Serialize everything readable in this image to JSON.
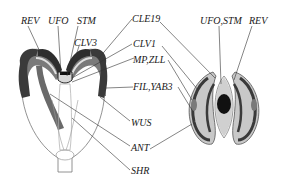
{
  "diagram": {
    "type": "gene expression schematic",
    "panels": [
      {
        "id": "longitudinal",
        "description": "longitudinal section of embryo"
      },
      {
        "id": "transverse",
        "description": "transverse section of shoot apex"
      }
    ],
    "labels": {
      "rev_left": "REV",
      "ufo": "UFO",
      "stm": "STM",
      "clv3": "CLV3",
      "cle19": "CLE19",
      "clv1": "CLV1",
      "mp_zll": "MP,ZLL",
      "fil_yab3": "FIL,YAB3",
      "wus": "WUS",
      "ant": "ANT",
      "shr": "SHR",
      "ufo_stm_right": "UFO,STM",
      "rev_right": "REV"
    },
    "colors": {
      "dark": "#3a3a3a",
      "medium": "#7a7a7a",
      "light": "#c8c8c8",
      "outline": "#555555",
      "core": "#111111",
      "line": "#333333"
    }
  }
}
